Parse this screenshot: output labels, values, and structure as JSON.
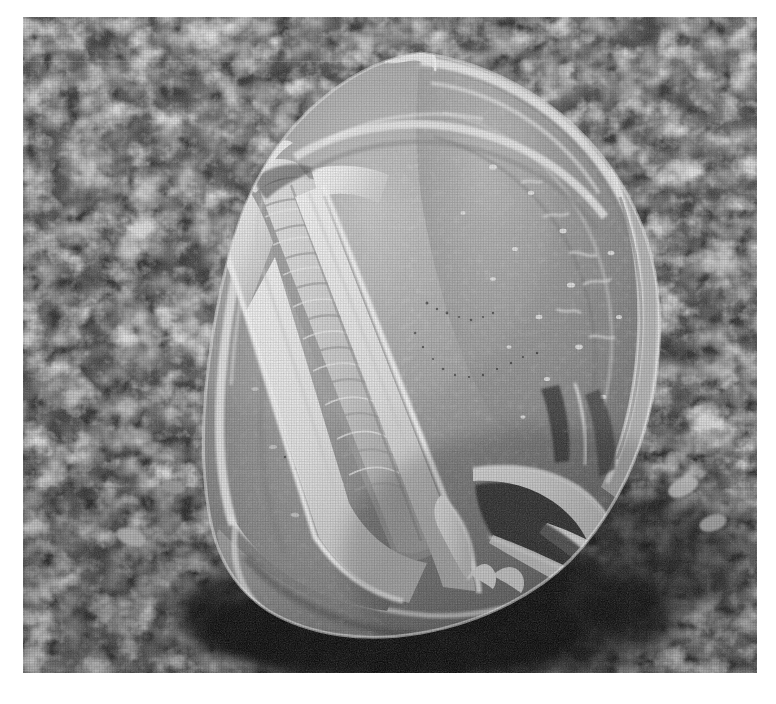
{
  "figure": {
    "kind": "scanning-electron-micrograph",
    "subject_detail": "tricolpate pollen grain resting on a porous filter membrane",
    "orientation": "oblique polar-equatorial view",
    "caption": "",
    "title": "",
    "alt_text": "Black and white scanning electron micrograph of a single spheroidal pollen grain with deep longitudinal furrows, lying on a rough porous substrate."
  },
  "plate": {
    "x": 23,
    "y": 17,
    "width": 734,
    "height": 656,
    "page_background": "#ffffff",
    "border": "none"
  },
  "palette": {
    "page": "#ffffff",
    "background_shadow": "#101010",
    "background_dark": "#1d1d1d",
    "background_mid": "#6a6a6a",
    "background_light": "#c8c8c8",
    "grain_body_dark": "#6e6e6e",
    "grain_body_mid": "#8f8f8f",
    "grain_body_light": "#b4b4b4",
    "grain_ridge": "#e8e8e8",
    "grain_highlight": "#f6f6f6",
    "grain_shadow": "#3c3c3c"
  },
  "structures": [
    {
      "name": "pollen-grain-body",
      "label": "pollen grain body",
      "note": "spheroidal, ~460 px wide"
    },
    {
      "name": "colpus-primary",
      "label": "primary colpus (furrow)",
      "note": "broad open furrow running upper-left to lower-centre"
    },
    {
      "name": "colpus-secondary",
      "label": "secondary colpus",
      "note": "narrow furrow along right margin"
    },
    {
      "name": "colpus-membrane",
      "label": "colpus membrane",
      "note": "transversely striated membrane inside the open furrow"
    },
    {
      "name": "apertural-ridge",
      "label": "apertural ridge / margo",
      "note": "raised bright rim bounding each furrow"
    },
    {
      "name": "lower-aperture-complex",
      "label": "lower aperture complex",
      "note": "splayed flap-like ridges at lower right"
    },
    {
      "name": "apical-protrusion",
      "label": "apical protrusion",
      "note": "small knob at the top of the grain"
    },
    {
      "name": "basal-fold",
      "label": "basal fold",
      "note": "collapsed fold where the grain meets the substrate"
    },
    {
      "name": "substrate-membrane",
      "label": "porous filter membrane",
      "note": "granular, reticulate background substrate"
    },
    {
      "name": "contact-shadow",
      "label": "contact shadow",
      "note": "dark pool beneath the grain"
    }
  ],
  "scale_bar": {
    "present": false,
    "label": ""
  },
  "annotations": []
}
